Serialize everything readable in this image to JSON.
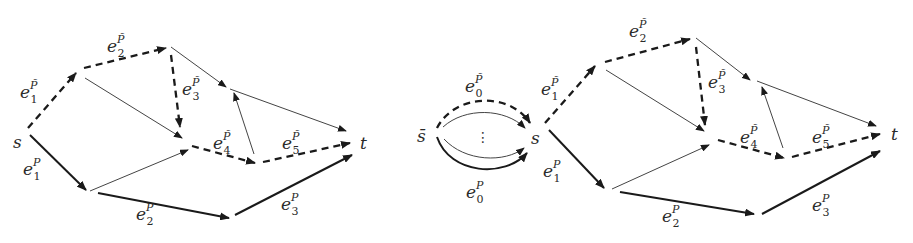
{
  "figure": {
    "panels": [
      {
        "id": "left",
        "source_label": "s",
        "sink_label": "t",
        "edge_labels": [
          {
            "base": "e",
            "sub": "1",
            "sup": "P̃",
            "x": 20,
            "y": 98
          },
          {
            "base": "e",
            "sub": "2",
            "sup": "P̃",
            "x": 107,
            "y": 52
          },
          {
            "base": "e",
            "sub": "3",
            "sup": "P̃",
            "x": 182,
            "y": 95
          },
          {
            "base": "e",
            "sub": "4",
            "sup": "P̃",
            "x": 213,
            "y": 149
          },
          {
            "base": "e",
            "sub": "5",
            "sup": "P̃",
            "x": 282,
            "y": 149
          },
          {
            "base": "e",
            "sub": "1",
            "sup": "P",
            "x": 23,
            "y": 175
          },
          {
            "base": "e",
            "sub": "2",
            "sup": "P",
            "x": 136,
            "y": 220
          },
          {
            "base": "e",
            "sub": "3",
            "sup": "P",
            "x": 281,
            "y": 210
          }
        ]
      },
      {
        "id": "right",
        "super_source_label": "s̄",
        "source_label": "s",
        "sink_label": "t",
        "ellipsis": "⋮",
        "edge_labels": [
          {
            "base": "e",
            "sub": "0",
            "sup": "P̃",
            "x": 465,
            "y": 92
          },
          {
            "base": "e",
            "sub": "0",
            "sup": "P",
            "x": 466,
            "y": 198
          },
          {
            "base": "e",
            "sub": "1",
            "sup": "P̃",
            "x": 541,
            "y": 95
          },
          {
            "base": "e",
            "sub": "2",
            "sup": "P̃",
            "x": 629,
            "y": 37
          },
          {
            "base": "e",
            "sub": "3",
            "sup": "P̃",
            "x": 708,
            "y": 88
          },
          {
            "base": "e",
            "sub": "4",
            "sup": "P̃",
            "x": 740,
            "y": 143
          },
          {
            "base": "e",
            "sub": "5",
            "sup": "P̃",
            "x": 812,
            "y": 143
          },
          {
            "base": "e",
            "sub": "1",
            "sup": "P",
            "x": 543,
            "y": 177
          },
          {
            "base": "e",
            "sub": "2",
            "sup": "P",
            "x": 662,
            "y": 222
          },
          {
            "base": "e",
            "sub": "3",
            "sup": "P",
            "x": 812,
            "y": 211
          }
        ]
      }
    ],
    "legend_styles": {
      "dashed_path": "P̃ (dashed, thick)",
      "solid_path": "P (solid, thick)",
      "other_edges": "thin solid"
    },
    "colors": {
      "ink": "#1a1a1a",
      "thin": "#444444",
      "background": "#ffffff"
    }
  }
}
